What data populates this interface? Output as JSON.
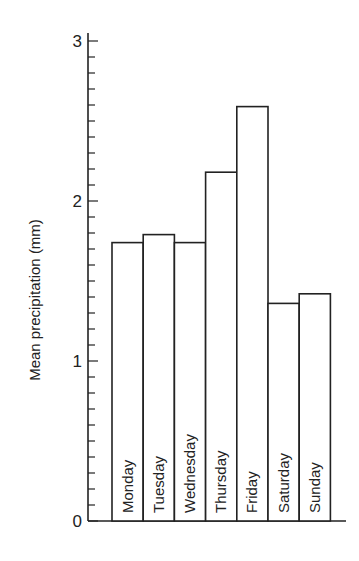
{
  "chart_data": {
    "type": "bar",
    "title": "",
    "xlabel": "",
    "ylabel": "Mean precipitation (mm)",
    "categories": [
      "Monday",
      "Tuesday",
      "Wednesday",
      "Thursday",
      "Friday",
      "Saturday",
      "Sunday"
    ],
    "values": [
      1.74,
      1.79,
      1.74,
      2.18,
      2.59,
      1.36,
      1.42
    ],
    "ylim": [
      0,
      3
    ],
    "yticks": [
      "0",
      "1",
      "2",
      "3"
    ],
    "minor_tick_step": 0.1,
    "grid": false,
    "legend": null,
    "category_labels_inside_bars": true
  },
  "colors": {
    "line": "#222222",
    "background": "#ffffff",
    "bar_fill": "#ffffff"
  }
}
